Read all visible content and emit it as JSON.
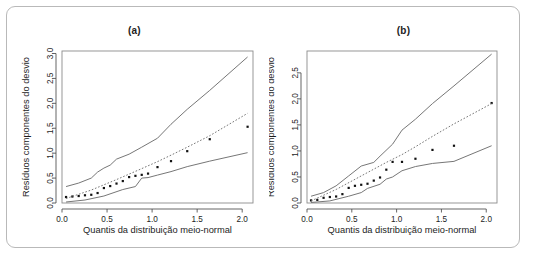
{
  "figure": {
    "frame_color": "#b9b9b9",
    "background": "#ffffff"
  },
  "panels": [
    {
      "id": "a",
      "title": "(a)"
    },
    {
      "id": "b",
      "title": "(b)"
    }
  ],
  "labels": {
    "xlabel": "Quantis da distribuição meio-normal",
    "ylabel": "Resíduos componentes do desvio"
  },
  "chart_data": [
    {
      "type": "scatter",
      "title": "(a)",
      "xlabel": "Quantis da distribuição meio-normal",
      "ylabel": "Resíduos componentes do desvio",
      "xlim": [
        0.0,
        2.12
      ],
      "ylim": [
        0.0,
        3.05
      ],
      "xticks": [
        "0.0",
        "0.5",
        "1.0",
        "1.5",
        "2.0"
      ],
      "xtickvals": [
        0.0,
        0.5,
        1.0,
        1.5,
        2.0
      ],
      "yticks": [
        "0.0",
        "0.5",
        "1.0",
        "1.5",
        "2.0",
        "2.5",
        "3.0"
      ],
      "ytickvals": [
        0.0,
        0.5,
        1.0,
        1.5,
        2.0,
        2.5,
        3.0
      ],
      "grid": false,
      "legend": "none",
      "series": [
        {
          "name": "observed-points",
          "style": "points",
          "x": [
            0.045,
            0.115,
            0.185,
            0.255,
            0.325,
            0.395,
            0.465,
            0.535,
            0.605,
            0.675,
            0.745,
            0.815,
            0.885,
            0.955,
            1.06,
            1.21,
            1.39,
            1.64,
            2.06
          ],
          "y": [
            0.12,
            0.13,
            0.14,
            0.155,
            0.165,
            0.2,
            0.3,
            0.34,
            0.39,
            0.44,
            0.52,
            0.545,
            0.565,
            0.59,
            0.72,
            0.84,
            1.04,
            1.28,
            1.53
          ]
        },
        {
          "name": "upper-envelope",
          "style": "solid-line",
          "x": [
            0.045,
            0.185,
            0.325,
            0.395,
            0.465,
            0.535,
            0.605,
            0.745,
            0.885,
            1.06,
            1.21,
            1.39,
            1.64,
            2.06
          ],
          "y": [
            0.33,
            0.4,
            0.5,
            0.62,
            0.7,
            0.76,
            0.88,
            0.98,
            1.12,
            1.3,
            1.58,
            1.88,
            2.26,
            2.93
          ]
        },
        {
          "name": "median-envelope",
          "style": "dotted-line",
          "x": [
            0.045,
            0.325,
            0.605,
            0.885,
            1.06,
            1.21,
            1.39,
            1.64,
            2.06
          ],
          "y": [
            0.09,
            0.26,
            0.47,
            0.69,
            0.83,
            0.96,
            1.12,
            1.35,
            1.8
          ]
        },
        {
          "name": "lower-envelope",
          "style": "solid-line",
          "x": [
            0.045,
            0.255,
            0.465,
            0.675,
            0.815,
            0.885,
            0.955,
            1.06,
            1.21,
            1.39,
            1.64,
            2.06
          ],
          "y": [
            0.02,
            0.06,
            0.14,
            0.27,
            0.33,
            0.5,
            0.51,
            0.56,
            0.63,
            0.73,
            0.84,
            1.01
          ]
        }
      ]
    },
    {
      "type": "scatter",
      "title": "(b)",
      "xlabel": "Quantis da distribuição meio-normal",
      "ylabel": "Resíduos componentes do desvio",
      "xlim": [
        0.0,
        2.12
      ],
      "ylim": [
        0.0,
        2.92
      ],
      "xticks": [
        "0.0",
        "0.5",
        "1.0",
        "1.5",
        "2.0"
      ],
      "xtickvals": [
        0.0,
        0.5,
        1.0,
        1.5,
        2.0
      ],
      "yticks": [
        "0.0",
        "0.5",
        "1.0",
        "1.5",
        "2.0",
        "2.5"
      ],
      "ytickvals": [
        0.0,
        0.5,
        1.0,
        1.5,
        2.0,
        2.5
      ],
      "grid": false,
      "legend": "none",
      "series": [
        {
          "name": "observed-points",
          "style": "points",
          "x": [
            0.045,
            0.115,
            0.185,
            0.255,
            0.325,
            0.395,
            0.465,
            0.535,
            0.605,
            0.675,
            0.745,
            0.815,
            0.885,
            0.955,
            1.06,
            1.21,
            1.4,
            1.64,
            2.06
          ],
          "y": [
            0.05,
            0.06,
            0.1,
            0.115,
            0.125,
            0.17,
            0.29,
            0.33,
            0.35,
            0.37,
            0.43,
            0.49,
            0.64,
            0.79,
            0.79,
            0.85,
            1.02,
            1.1,
            1.92
          ]
        },
        {
          "name": "upper-envelope",
          "style": "solid-line",
          "x": [
            0.045,
            0.185,
            0.325,
            0.465,
            0.605,
            0.745,
            0.815,
            0.955,
            1.06,
            1.21,
            1.4,
            1.64,
            2.06
          ],
          "y": [
            0.13,
            0.2,
            0.33,
            0.52,
            0.71,
            0.78,
            0.9,
            1.13,
            1.4,
            1.61,
            1.91,
            2.25,
            2.86
          ]
        },
        {
          "name": "median-envelope",
          "style": "dotted-line",
          "x": [
            0.045,
            0.325,
            0.605,
            0.885,
            1.06,
            1.21,
            1.4,
            1.64,
            2.06
          ],
          "y": [
            0.04,
            0.26,
            0.52,
            0.78,
            0.93,
            1.08,
            1.28,
            1.52,
            1.91
          ]
        },
        {
          "name": "lower-envelope",
          "style": "solid-line",
          "x": [
            0.045,
            0.255,
            0.465,
            0.605,
            0.675,
            0.815,
            0.885,
            0.955,
            1.06,
            1.21,
            1.4,
            1.64,
            2.06
          ],
          "y": [
            0.01,
            0.04,
            0.13,
            0.2,
            0.28,
            0.36,
            0.46,
            0.5,
            0.62,
            0.7,
            0.76,
            0.8,
            1.1
          ]
        }
      ]
    }
  ]
}
